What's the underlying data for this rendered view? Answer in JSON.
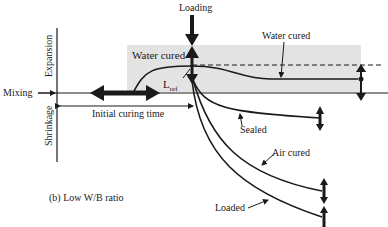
{
  "labels": {
    "loading": "Loading",
    "water_cured_box": "Water cured",
    "water_cured_curve": "Water cured",
    "l_ref_main": "L",
    "l_ref_sub": "ref",
    "mixing": "Mixing",
    "initial_curing_time": "Initial curing time",
    "expansion": "Expansion",
    "shrinkage": "Shrinkage",
    "sealed": "Sealed",
    "air_cured": "Air cured",
    "loaded": "Loaded",
    "caption": "(b) Low W/B ratio"
  },
  "colors": {
    "ink": "#1a1a1a",
    "shade": "#e3e3e3",
    "background": "#ffffff"
  }
}
